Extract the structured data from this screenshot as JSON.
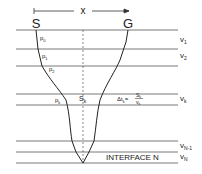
{
  "diagram": {
    "offset_label": "x",
    "source_label": "S",
    "receiver_label": "G",
    "layers": [
      {
        "label": "v",
        "sub": "1"
      },
      {
        "label": "v",
        "sub": "2"
      },
      {
        "label": "v",
        "sub": "k"
      },
      {
        "label": "v",
        "sub": "N-1"
      },
      {
        "label": "v",
        "sub": "N"
      }
    ],
    "angles": [
      {
        "label": "p",
        "sub": "0"
      },
      {
        "label": "p",
        "sub": "1"
      },
      {
        "label": "p",
        "sub": "2"
      },
      {
        "label": "p",
        "sub": "k"
      }
    ],
    "segment_label": {
      "label": "S",
      "sub": "k"
    },
    "travel_time_formula": {
      "lhs": "Δt",
      "lhs_sub": "k",
      "num": "S",
      "num_sub": "k",
      "den": "v",
      "den_sub": "k"
    },
    "interface_label": "INTERFACE N",
    "colors": {
      "line": "#333333",
      "layer_line": "#555555",
      "text": "#222222"
    }
  }
}
